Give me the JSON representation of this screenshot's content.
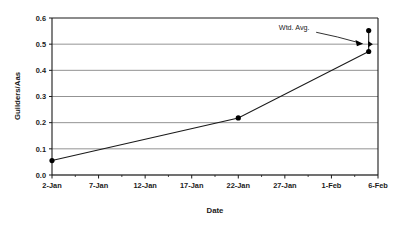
{
  "chart_data": {
    "type": "line",
    "title": "",
    "xlabel": "Date",
    "ylabel": "Guilders/Aas",
    "xlim": [
      0,
      35
    ],
    "ylim": [
      0.0,
      0.6
    ],
    "grid": "horizontal",
    "legend": "none",
    "x_tick_labels": [
      "2-Jan",
      "7-Jan",
      "12-Jan",
      "17-Jan",
      "22-Jan",
      "27-Jan",
      "1-Feb",
      "6-Feb"
    ],
    "x_tick_values": [
      0,
      5,
      10,
      15,
      20,
      25,
      30,
      35
    ],
    "y_tick_labels": [
      "0.0",
      "0.1",
      "0.2",
      "0.3",
      "0.4",
      "0.5",
      "0.6"
    ],
    "y_tick_values": [
      0.0,
      0.1,
      0.2,
      0.3,
      0.4,
      0.5,
      0.6
    ],
    "series": [
      {
        "name": "Guilders/Aas",
        "marker": "circle",
        "x": [
          0,
          20,
          34,
          34
        ],
        "values": [
          0.055,
          0.218,
          0.472,
          0.552
        ],
        "points": [
          {
            "x_label": "2-Jan",
            "x": 0,
            "y": 0.055
          },
          {
            "x_label": "22-Jan",
            "x": 20,
            "y": 0.218
          },
          {
            "x_label": "6-Feb",
            "x": 34,
            "y": 0.472
          },
          {
            "x_label": "6-Feb",
            "x": 34,
            "y": 0.552
          }
        ]
      }
    ],
    "annotations": [
      {
        "text": "Wtd. Avg.",
        "target_x": 34,
        "target_y": 0.5,
        "label_x": 26,
        "label_y": 0.555,
        "marker": "triangle-right",
        "arrow": true
      }
    ],
    "colors": {
      "background": "#ffffff",
      "plot_background": "#ffffff",
      "gridline": "#808080",
      "axis": "#1a1a1a",
      "series_line": "#1a1a1a",
      "marker": "#000000",
      "text": "#1a1a1a"
    }
  }
}
